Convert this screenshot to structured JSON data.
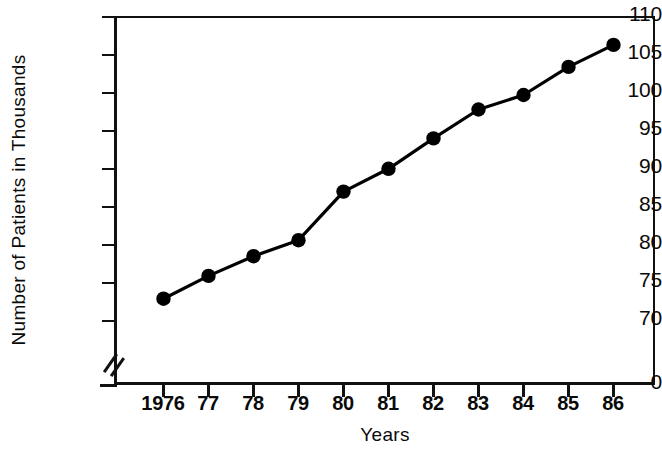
{
  "chart_data": {
    "type": "line",
    "title": "",
    "xlabel": "Years",
    "ylabel": "Number of Patients in Thousands",
    "categories": [
      "1976",
      "77",
      "78",
      "79",
      "80",
      "81",
      "82",
      "83",
      "84",
      "85",
      "86"
    ],
    "x_tick_labels": [
      "1976",
      "77",
      "78",
      "79",
      "80",
      "81",
      "82",
      "83",
      "84",
      "85",
      "86"
    ],
    "y_tick_labels": [
      "110",
      "105",
      "100",
      "95",
      "90",
      "85",
      "80",
      "75",
      "70",
      "0"
    ],
    "y_ticks": [
      110,
      105,
      100,
      95,
      90,
      85,
      80,
      75,
      70,
      0
    ],
    "ylim": [
      70,
      110
    ],
    "y_axis_break": true,
    "y_axis_break_note": "axis broken between 0 and 70",
    "grid": false,
    "legend": false,
    "legend_position": "none",
    "marker": "filled-circle",
    "series": [
      {
        "name": "Number of Patients in Thousands",
        "color": "#000000",
        "values": [
          72.8,
          75.8,
          78.4,
          80.5,
          86.9,
          89.9,
          93.9,
          97.7,
          99.6,
          103.3,
          106.2
        ]
      }
    ],
    "points": [
      {
        "x": "1976",
        "y": 72.8
      },
      {
        "x": "77",
        "y": 75.8
      },
      {
        "x": "78",
        "y": 78.4
      },
      {
        "x": "79",
        "y": 80.5
      },
      {
        "x": "80",
        "y": 86.9
      },
      {
        "x": "81",
        "y": 89.9
      },
      {
        "x": "82",
        "y": 93.9
      },
      {
        "x": "83",
        "y": 97.7
      },
      {
        "x": "84",
        "y": 99.6
      },
      {
        "x": "85",
        "y": 103.3
      },
      {
        "x": "86",
        "y": 106.2
      }
    ]
  },
  "axes": {
    "y_title": "Number of Patients in Thousands",
    "x_title": "Years"
  },
  "colors": {
    "line": "#000000",
    "marker": "#000000",
    "axis": "#111111",
    "background": "#ffffff"
  }
}
